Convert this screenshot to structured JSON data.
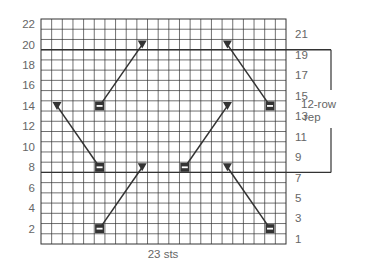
{
  "chart_data": {
    "type": "knitting-chart",
    "stitches": 23,
    "rows": 22,
    "bottom_label": "23 sts",
    "left_row_labels": [
      "2",
      "4",
      "6",
      "8",
      "10",
      "12",
      "14",
      "16",
      "18",
      "20",
      "22"
    ],
    "right_row_labels": [
      "1",
      "3",
      "5",
      "7",
      "9",
      "11",
      "13",
      "15",
      "17",
      "19",
      "21"
    ],
    "repeat": {
      "label_line1": "12-row",
      "label_line2": "rep",
      "from_row": 8,
      "to_row": 19
    },
    "symbols": [
      {
        "type": "triangle",
        "row": 20,
        "col": 10
      },
      {
        "type": "dash",
        "row": 14,
        "col": 6
      },
      {
        "type": "triangle",
        "row": 14,
        "col": 2
      },
      {
        "type": "dash",
        "row": 8,
        "col": 6
      },
      {
        "type": "triangle",
        "row": 8,
        "col": 10
      },
      {
        "type": "dash",
        "row": 2,
        "col": 6
      },
      {
        "type": "triangle",
        "row": 20,
        "col": 18
      },
      {
        "type": "dash",
        "row": 14,
        "col": 22
      },
      {
        "type": "triangle",
        "row": 14,
        "col": 18
      },
      {
        "type": "dash",
        "row": 8,
        "col": 14
      },
      {
        "type": "triangle",
        "row": 8,
        "col": 18
      },
      {
        "type": "dash",
        "row": 2,
        "col": 22
      }
    ],
    "connectors": [
      {
        "from": {
          "row": 20,
          "col": 10
        },
        "to": {
          "row": 14,
          "col": 6
        }
      },
      {
        "from": {
          "row": 14,
          "col": 2
        },
        "to": {
          "row": 8,
          "col": 6
        }
      },
      {
        "from": {
          "row": 8,
          "col": 10
        },
        "to": {
          "row": 2,
          "col": 6
        }
      },
      {
        "from": {
          "row": 20,
          "col": 18
        },
        "to": {
          "row": 14,
          "col": 22
        }
      },
      {
        "from": {
          "row": 14,
          "col": 18
        },
        "to": {
          "row": 8,
          "col": 14
        }
      },
      {
        "from": {
          "row": 8,
          "col": 18
        },
        "to": {
          "row": 2,
          "col": 22
        }
      }
    ],
    "colors": {
      "grid": "#333333",
      "symbol": "#333333",
      "label": "#666666"
    }
  }
}
